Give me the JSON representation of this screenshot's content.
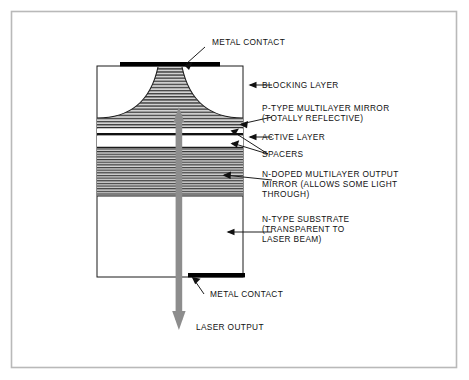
{
  "figure": {
    "background_color": "#ffffff",
    "frame_color": "#b9b9b9",
    "ink_color": "#111111",
    "stripe_color": "#4a4a4a",
    "fill_gray": "#c9c9c9",
    "arrow_color": "#8d8d8d",
    "contact_color": "#000000"
  },
  "labels": {
    "metal_contact_top": "METAL CONTACT",
    "blocking_layer": "BLOCKING LAYER",
    "p_type_mirror_line1": "P-TYPE MULTILAYER MIRROR",
    "p_type_mirror_line2": "(TOTALLY REFLECTIVE)",
    "active_layer": "ACTIVE LAYER",
    "spacers": "SPACERS",
    "n_doped_line1": "N-DOPED MULTILAYER OUTPUT",
    "n_doped_line2": "MIRROR (ALLOWS SOME LIGHT",
    "n_doped_line3": "THROUGH)",
    "n_substrate_line1": "N-TYPE SUBSTRATE",
    "n_substrate_line2": "(TRANSPARENT TO",
    "n_substrate_line3": "LASER BEAM)",
    "metal_contact_bottom": "METAL CONTACT",
    "laser_output": "LASER OUTPUT"
  },
  "layers": [
    {
      "id": "blocking-layer",
      "name": "BLOCKING LAYER",
      "y_top": 66,
      "y_bottom": 118,
      "fill": "none"
    },
    {
      "id": "p-type-mirror",
      "name": "P-TYPE MULTILAYER MIRROR",
      "y_top": 100,
      "y_bottom": 128,
      "fill": "striped"
    },
    {
      "id": "upper-spacer",
      "name": "SPACERS",
      "y_top": 128,
      "y_bottom": 133,
      "fill": "none"
    },
    {
      "id": "active-layer",
      "name": "ACTIVE LAYER",
      "y_top": 133,
      "y_bottom": 136,
      "fill": "solid"
    },
    {
      "id": "lower-spacer",
      "name": "SPACERS",
      "y_top": 136,
      "y_bottom": 148,
      "fill": "none"
    },
    {
      "id": "n-doped-mirror",
      "name": "N-DOPED MULTILAYER OUTPUT MIRROR",
      "y_top": 148,
      "y_bottom": 196,
      "fill": "striped"
    },
    {
      "id": "n-type-substrate",
      "name": "N-TYPE SUBSTRATE",
      "y_top": 196,
      "y_bottom": 277,
      "fill": "none"
    }
  ],
  "contacts": {
    "top": {
      "x": 120,
      "y": 63,
      "width": 100,
      "height": 4
    },
    "bottom": {
      "x": 188,
      "y": 273,
      "width": 57,
      "height": 4
    }
  },
  "beam": {
    "name": "laser beam",
    "x": 179,
    "y_top": 108,
    "y_bottom": 328,
    "double_headed": true
  }
}
